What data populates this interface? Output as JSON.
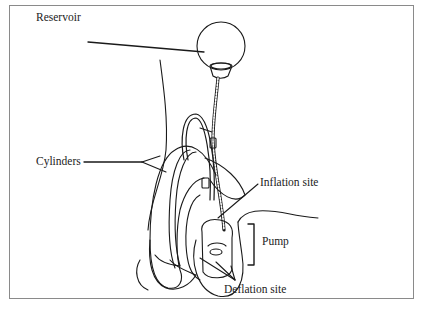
{
  "diagram": {
    "labels": {
      "reservoir": "Reservoir",
      "cylinders": "Cylinders",
      "inflation_site": "Inflation site",
      "pump": "Pump",
      "deflation_site": "Deflation site"
    },
    "colors": {
      "line": "#1a1a1a",
      "frame": "#8a8a8a",
      "background": "#ffffff"
    }
  }
}
